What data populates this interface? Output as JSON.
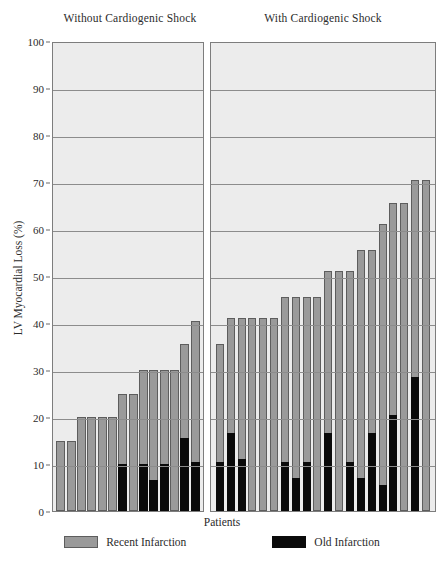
{
  "chart_data": {
    "type": "bar",
    "title": "",
    "xlabel": "Patients",
    "ylabel": "LV Myocardial Loss (%)",
    "ylim": [
      0,
      100
    ],
    "ytick_values": [
      0,
      10,
      20,
      30,
      40,
      50,
      60,
      70,
      80,
      90,
      100
    ],
    "ytick_labels": [
      "0",
      "10",
      "20",
      "30",
      "40",
      "50",
      "60",
      "70",
      "80",
      "90",
      "100"
    ],
    "grid": "horizontal",
    "stacked": true,
    "legend_position": "bottom",
    "legend": [
      {
        "name": "Recent Infarction",
        "color": "#9a9a9a"
      },
      {
        "name": "Old Infarction",
        "color": "#0a0a0a"
      }
    ],
    "panels": [
      {
        "title": "Without Cardiogenic Shock",
        "n_patients": 12,
        "series": [
          {
            "name": "Total",
            "values": [
              15,
              15,
              20,
              20,
              20,
              20,
              25,
              25,
              30,
              30,
              30,
              30,
              35.5,
              40.5
            ]
          },
          {
            "name": "Old Infarction",
            "values": [
              0,
              0,
              0,
              0,
              0,
              0,
              10,
              0,
              10,
              6.5,
              10,
              15.5,
              10.5
            ]
          }
        ],
        "bars": [
          {
            "total": 15,
            "old": 0
          },
          {
            "total": 15,
            "old": 0
          },
          {
            "total": 20,
            "old": 0
          },
          {
            "total": 20,
            "old": 0
          },
          {
            "total": 20,
            "old": 0
          },
          {
            "total": 20,
            "old": 0
          },
          {
            "total": 25,
            "old": 10
          },
          {
            "total": 25,
            "old": 0
          },
          {
            "total": 30,
            "old": 10
          },
          {
            "total": 30,
            "old": 6.5
          },
          {
            "total": 30,
            "old": 10
          },
          {
            "total": 30,
            "old": 0
          },
          {
            "total": 35.5,
            "old": 15.5
          },
          {
            "total": 40.5,
            "old": 10.5
          }
        ]
      },
      {
        "title": "With Cardiogenic Shock",
        "n_patients": 18,
        "bars": [
          {
            "total": 35.5,
            "old": 10.5
          },
          {
            "total": 41,
            "old": 16.5
          },
          {
            "total": 41,
            "old": 11
          },
          {
            "total": 41,
            "old": 0
          },
          {
            "total": 41,
            "old": 0
          },
          {
            "total": 41,
            "old": 0
          },
          {
            "total": 45.5,
            "old": 10.5
          },
          {
            "total": 45.5,
            "old": 7
          },
          {
            "total": 45.5,
            "old": 10.5
          },
          {
            "total": 45.5,
            "old": 0
          },
          {
            "total": 51,
            "old": 16.5
          },
          {
            "total": 51,
            "old": 0
          },
          {
            "total": 51,
            "old": 10.5
          },
          {
            "total": 55.5,
            "old": 7
          },
          {
            "total": 55.5,
            "old": 16.5
          },
          {
            "total": 61,
            "old": 5.5
          },
          {
            "total": 65.5,
            "old": 20.5
          },
          {
            "total": 65.5,
            "old": 0
          },
          {
            "total": 70.5,
            "old": 28.5
          },
          {
            "total": 70.5,
            "old": 0
          }
        ]
      }
    ]
  }
}
